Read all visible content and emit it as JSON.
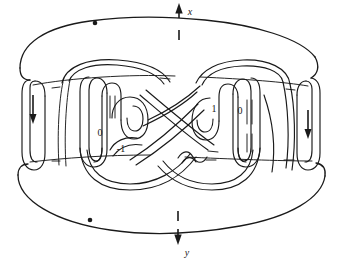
{
  "figure": {
    "background_color": "#ffffff",
    "ink_color": "#1a1a1a"
  },
  "axes": {
    "top": {
      "label": "x",
      "arrow_direction": "up",
      "tick": "|",
      "icon": "arrow-up-icon"
    },
    "bottom": {
      "label": "y",
      "arrow_direction": "down",
      "tick": "|",
      "icon": "arrow-down-icon"
    }
  },
  "markers": {
    "top_basepoint": "•",
    "bottom_basepoint": "•"
  },
  "band_arrows": {
    "left": {
      "direction": "down",
      "icon": "arrow-down-icon"
    },
    "right": {
      "direction": "down",
      "icon": "arrow-down-icon"
    }
  },
  "coefficients": [
    {
      "id": "left-outer",
      "value": "0"
    },
    {
      "id": "left-inner",
      "value": "-1"
    },
    {
      "id": "right-outer",
      "value": "1"
    },
    {
      "id": "right-inner",
      "value": "0"
    }
  ],
  "labels": {
    "coef_left_outer": "0",
    "coef_left_inner": "-1",
    "coef_right_outer": "1",
    "coef_right_inner": "0",
    "axis_top": "x",
    "axis_bottom": "y"
  }
}
